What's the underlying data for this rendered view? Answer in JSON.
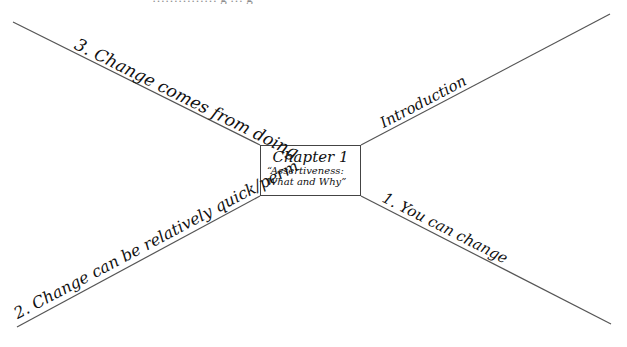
{
  "diagram": {
    "type": "mind-map",
    "top_clipped_text": "…………… g … g",
    "center": {
      "title": "Chapter 1",
      "subtitle_line1": "“Assertiveness:",
      "subtitle_line2": "What and Why”"
    },
    "branches": [
      {
        "id": "upper-left",
        "label": "3. Change comes from doing"
      },
      {
        "id": "upper-right",
        "label": "Introduction"
      },
      {
        "id": "lower-right",
        "label": "1. You can change"
      },
      {
        "id": "lower-left",
        "label": "2. Change can be relatively quick/perm"
      }
    ],
    "colors": {
      "line": "#555555",
      "text": "#111111",
      "background": "#ffffff"
    }
  }
}
